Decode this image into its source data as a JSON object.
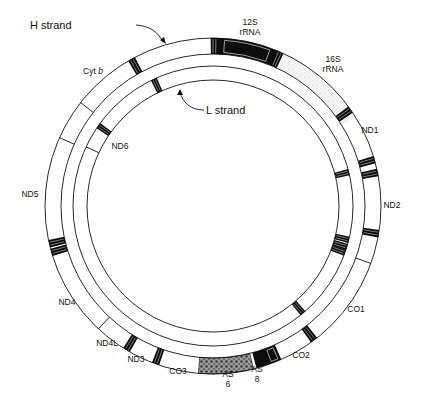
{
  "diagram": {
    "center": {
      "x": 213,
      "y": 206
    },
    "h_ring": {
      "outer_r": 168,
      "inner_r": 152
    },
    "l_ring": {
      "outer_r": 140,
      "inner_r": 126
    },
    "colors": {
      "line": "#111111",
      "black": "#0d0d0d",
      "stipple": "#cfcfcf",
      "stipple_dark": "#6a6a6a"
    },
    "strand_labels": {
      "h_strand": "H strand",
      "l_strand": "L strand"
    },
    "gene_labels": [
      {
        "id": "12s",
        "lines": [
          "12S",
          "rRNA"
        ],
        "x": 250,
        "y": 25
      },
      {
        "id": "16s",
        "lines": [
          "16S",
          "rRNA"
        ],
        "x": 333,
        "y": 62
      },
      {
        "id": "nd1",
        "lines": [
          "ND1"
        ],
        "x": 370,
        "y": 133
      },
      {
        "id": "nd2",
        "lines": [
          "ND2"
        ],
        "x": 392,
        "y": 208
      },
      {
        "id": "co1",
        "lines": [
          "CO1"
        ],
        "x": 356,
        "y": 312
      },
      {
        "id": "co2",
        "lines": [
          "CO2"
        ],
        "x": 301,
        "y": 358
      },
      {
        "id": "as8",
        "lines": [
          "AS",
          "8"
        ],
        "x": 257,
        "y": 372
      },
      {
        "id": "as6",
        "lines": [
          "AS",
          "6"
        ],
        "x": 228,
        "y": 377
      },
      {
        "id": "co3",
        "lines": [
          "CO3"
        ],
        "x": 178,
        "y": 374
      },
      {
        "id": "nd3",
        "lines": [
          "ND3"
        ],
        "x": 136,
        "y": 362
      },
      {
        "id": "nd4l",
        "lines": [
          "ND4L"
        ],
        "x": 107,
        "y": 346
      },
      {
        "id": "nd4",
        "lines": [
          "ND4"
        ],
        "x": 67,
        "y": 305
      },
      {
        "id": "nd5",
        "lines": [
          "ND5"
        ],
        "x": 30,
        "y": 197
      },
      {
        "id": "nd6",
        "lines": [
          "ND6"
        ],
        "x": 120,
        "y": 149
      },
      {
        "id": "cytb",
        "lines": [
          "Cyt b"
        ],
        "x": 93,
        "y": 74
      }
    ],
    "h_ring_features": {
      "rrna12s_block": {
        "start_deg": 1,
        "end_deg": 23
      },
      "rrna16s_stipple": {
        "start_deg": 23,
        "end_deg": 58
      },
      "as8_block": {
        "start_deg": 156,
        "end_deg": 165
      },
      "as6_stipple": {
        "start_deg": 166,
        "end_deg": 185
      },
      "trna_bands_deg": [
        0.5,
        23.5,
        55,
        74,
        78.5,
        99.5,
        143,
        200,
        211,
        254,
        257,
        331
      ],
      "dividers_deg": [
        110,
        223,
        294,
        308
      ]
    },
    "l_ring_features": {
      "trna_bands_deg": [
        76,
        104,
        107,
        109.5,
        140,
        305,
        335
      ],
      "dividers_deg": [
        295
      ]
    }
  }
}
